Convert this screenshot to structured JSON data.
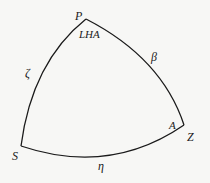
{
  "diagram": {
    "type": "spherical-triangle",
    "stroke_color": "#1a1a1a",
    "background": "#f7f7f5",
    "vertices": {
      "P": {
        "label": "P",
        "x": 86,
        "y": 19
      },
      "S": {
        "label": "S",
        "x": 21,
        "y": 146
      },
      "Z": {
        "label": "Z",
        "x": 184,
        "y": 125
      }
    },
    "angles": {
      "at_P": "LHA",
      "at_Z": "A"
    },
    "sides": {
      "PS": "ζ",
      "PZ": "β",
      "SZ": "η"
    }
  }
}
